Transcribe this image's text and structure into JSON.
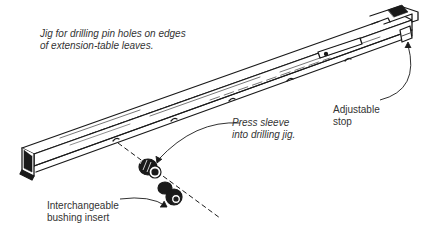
{
  "figure": {
    "caption": {
      "line1": "Jig for drilling pin holes on edges",
      "line2": "of extension-table leaves."
    },
    "callouts": {
      "adjustable_stop": {
        "line1": "Adjustable",
        "line2": "stop"
      },
      "press_sleeve": {
        "line1": "Press sleeve",
        "line2": "into drilling jig."
      },
      "bushing_insert": {
        "line1": "Interchangeable",
        "line2": "bushing insert"
      }
    },
    "colors": {
      "ink": "#1a1a1a",
      "text": "#333333",
      "background": "#ffffff"
    }
  }
}
